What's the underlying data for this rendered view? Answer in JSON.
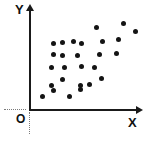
{
  "figure": {
    "name": "scatter-plot",
    "background_color": "#ffffff",
    "ink_color": "#141414"
  },
  "labels": {
    "y_axis": "Y",
    "x_axis": "X",
    "origin": "O"
  },
  "chart_data": {
    "type": "scatter",
    "title": "",
    "xlabel": "X",
    "ylabel": "Y",
    "origin_label": "O",
    "grid": false,
    "legend": null,
    "axis_ticks": {
      "x": [],
      "y": []
    },
    "axis_arrows": {
      "x": "right",
      "y": "up"
    },
    "xlim": [
      0,
      110
    ],
    "ylim": [
      0,
      100
    ],
    "n_points": 26,
    "points": [
      {
        "x": 13,
        "y": 14
      },
      {
        "x": 24,
        "y": 20
      },
      {
        "x": 22,
        "y": 31
      },
      {
        "x": 24,
        "y": 44
      },
      {
        "x": 31,
        "y": 58
      },
      {
        "x": 33,
        "y": 69
      },
      {
        "x": 35,
        "y": 42
      },
      {
        "x": 40,
        "y": 14
      },
      {
        "x": 44,
        "y": 70
      },
      {
        "x": 46,
        "y": 31
      },
      {
        "x": 48,
        "y": 57
      },
      {
        "x": 52,
        "y": 69
      },
      {
        "x": 53,
        "y": 43
      },
      {
        "x": 56,
        "y": 21
      },
      {
        "x": 60,
        "y": 15
      },
      {
        "x": 62,
        "y": 44
      },
      {
        "x": 65,
        "y": 59
      },
      {
        "x": 68,
        "y": 31
      },
      {
        "x": 72,
        "y": 23
      },
      {
        "x": 73,
        "y": 70
      },
      {
        "x": 75,
        "y": 83
      },
      {
        "x": 79,
        "y": 58
      },
      {
        "x": 83,
        "y": 70
      },
      {
        "x": 88,
        "y": 57
      },
      {
        "x": 96,
        "y": 88
      },
      {
        "x": 104,
        "y": 79
      }
    ],
    "pixel_points": [
      {
        "px": 42,
        "py": 96
      },
      {
        "px": 53,
        "py": 90
      },
      {
        "px": 51,
        "py": 85
      },
      {
        "px": 51,
        "py": 67
      },
      {
        "px": 53,
        "py": 54
      },
      {
        "px": 53,
        "py": 43
      },
      {
        "px": 62,
        "py": 79
      },
      {
        "px": 69,
        "py": 96
      },
      {
        "px": 62,
        "py": 42
      },
      {
        "px": 64,
        "py": 67
      },
      {
        "px": 62,
        "py": 55
      },
      {
        "px": 73,
        "py": 41
      },
      {
        "px": 80,
        "py": 85
      },
      {
        "px": 80,
        "py": 89
      },
      {
        "px": 89,
        "py": 84
      },
      {
        "px": 77,
        "py": 55
      },
      {
        "px": 81,
        "py": 66
      },
      {
        "px": 81,
        "py": 43
      },
      {
        "px": 94,
        "py": 67
      },
      {
        "px": 99,
        "py": 54
      },
      {
        "px": 101,
        "py": 78
      },
      {
        "px": 102,
        "py": 41
      },
      {
        "px": 96,
        "py": 27
      },
      {
        "px": 116,
        "py": 53
      },
      {
        "px": 118,
        "py": 39
      },
      {
        "px": 123,
        "py": 23
      },
      {
        "px": 135,
        "py": 31
      }
    ]
  }
}
